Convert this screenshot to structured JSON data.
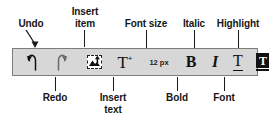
{
  "figure": {
    "type": "annotated-toolbar-diagram",
    "background_color": "#ffffff",
    "toolbar_fill": "#d7d7d7",
    "toolbar_border": "#7d7d7d",
    "label_color": "#161616"
  },
  "toolbar": {
    "name": "text-formatting-toolbar",
    "buttons": [
      {
        "key": "undo",
        "icon": "undo-arrow-icon",
        "label": "Undo",
        "value": ""
      },
      {
        "key": "redo",
        "icon": "redo-arrow-icon",
        "label": "Redo",
        "value": ""
      },
      {
        "key": "insert_item",
        "icon": "insert-picture-icon",
        "label": "Insert item",
        "value": ""
      },
      {
        "key": "insert_text",
        "icon": "insert-text-t-plus-icon",
        "label": "Insert text",
        "value": "T"
      },
      {
        "key": "font_size",
        "icon": "font-size-readout",
        "label": "Font size",
        "value": "12 px"
      },
      {
        "key": "bold",
        "icon": "bold-b-icon",
        "label": "Bold",
        "value": "B"
      },
      {
        "key": "italic",
        "icon": "italic-i-icon",
        "label": "Italic",
        "value": "I"
      },
      {
        "key": "font",
        "icon": "font-t-underline-icon",
        "label": "Font",
        "value": "T"
      },
      {
        "key": "highlight",
        "icon": "highlight-swatch-icon",
        "label": "Highlight",
        "value": "T"
      }
    ]
  },
  "callouts": {
    "top": [
      {
        "key": "undo",
        "text": "Undo"
      },
      {
        "key": "insert_item",
        "text": "Insert\nitem"
      },
      {
        "key": "font_size",
        "text": "Font size"
      },
      {
        "key": "italic",
        "text": "Italic"
      },
      {
        "key": "highlight",
        "text": "Highlight"
      }
    ],
    "bottom": [
      {
        "key": "redo",
        "text": "Redo"
      },
      {
        "key": "insert_text",
        "text": "Insert\ntext"
      },
      {
        "key": "bold",
        "text": "Bold"
      },
      {
        "key": "font",
        "text": "Font"
      }
    ]
  },
  "plus_symbol": "+"
}
